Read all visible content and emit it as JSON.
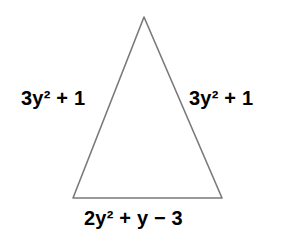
{
  "figure": {
    "type": "isosceles-triangle-with-algebraic-side-labels",
    "canvas": {
      "width": 281,
      "height": 243,
      "background_color": "#ffffff"
    },
    "shape": {
      "name": "triangle",
      "stroke_color": "#7a7a7a",
      "stroke_width": 1.6,
      "fill": "none",
      "vertices": {
        "apex": {
          "x": 144,
          "y": 17
        },
        "bottom_left": {
          "x": 73,
          "y": 198
        },
        "bottom_right": {
          "x": 222,
          "y": 198
        }
      }
    },
    "labels": {
      "left_side": "3y² + 1",
      "right_side": "3y² + 1",
      "base_side": "2y² + y − 3"
    },
    "text_color": "#000000"
  }
}
